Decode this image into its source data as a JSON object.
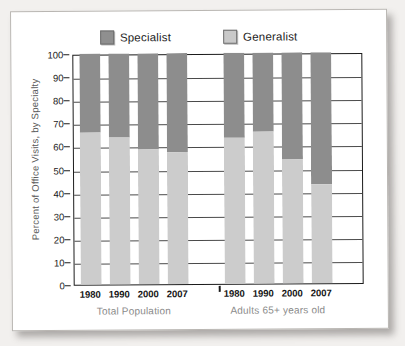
{
  "chart_data": {
    "type": "bar",
    "subtype": "stacked-bar-100",
    "title": "",
    "xlabel": "",
    "ylabel": "Percent of Office Visits, by Specialty",
    "ylim": [
      0,
      100
    ],
    "ytick_step": 10,
    "yticks": [
      "100",
      "90",
      "80",
      "70",
      "60",
      "50",
      "40",
      "30",
      "20",
      "10",
      "0"
    ],
    "grid": true,
    "grid_axis": "y",
    "legend_position": "top-center",
    "legend": [
      "Specialist",
      "Generalist"
    ],
    "colors": {
      "specialist": "#8d8d8d",
      "generalist": "#cccccc",
      "axis": "#1b1b1b",
      "grid": "#4a4a4a",
      "group_label": "#8a8a8a",
      "axis_title": "#585858",
      "paper": "#ffffff",
      "page_background": "#f2f0ee"
    },
    "groups": [
      {
        "name": "Total Population",
        "categories": [
          "1980",
          "1990",
          "2000",
          "2007"
        ],
        "series": [
          {
            "name": "Generalist",
            "values": [
              66,
              63.5,
              58.5,
              57
            ]
          },
          {
            "name": "Specialist",
            "values": [
              34,
              36.5,
              41.5,
              43
            ]
          }
        ]
      },
      {
        "name": "Adults 65+ years old",
        "categories": [
          "1980",
          "1990",
          "2000",
          "2007"
        ],
        "series": [
          {
            "name": "Generalist",
            "values": [
              63,
              66,
              53.5,
              43
            ]
          },
          {
            "name": "Specialist",
            "values": [
              37,
              34,
              46.5,
              57
            ]
          }
        ]
      }
    ]
  },
  "legend": {
    "specialist_label": "Specialist",
    "generalist_label": "Generalist"
  },
  "axis": {
    "y_title": "Percent of Office Visits, by Specialty"
  }
}
